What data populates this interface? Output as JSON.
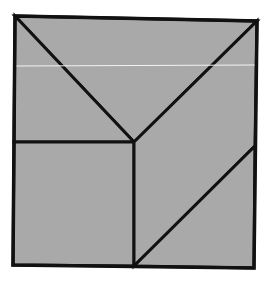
{
  "diagram": {
    "type": "geometric-dissection",
    "colors": {
      "background": "#ffffff",
      "fill": "#a9a9a9",
      "stroke": "#111111",
      "highlight_line": "#f4f4f4"
    },
    "outer_square": {
      "points": "15,16 257,21 254,268 13,265"
    },
    "center_vertex": {
      "x": 134,
      "y": 142
    },
    "pieces": [
      {
        "name": "top-triangle",
        "points": "15,16 257,21 134,142"
      },
      {
        "name": "left-triangle",
        "points": "15,16 134,142 14,142"
      },
      {
        "name": "bottom-left-square",
        "points": "14,142 134,142 134,266 13,265"
      },
      {
        "name": "right-quadrilateral",
        "points": "134,142 257,21 255,146 134,266"
      },
      {
        "name": "bottom-right-triangle",
        "points": "255,146 254,268 134,266"
      }
    ],
    "highlight": {
      "x1": 16,
      "y1": 66,
      "x2": 256,
      "y2": 65
    }
  }
}
